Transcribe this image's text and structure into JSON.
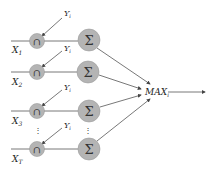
{
  "diagram": {
    "rows": [
      {
        "input": "X",
        "input_sub": "1",
        "weight": "Y",
        "weight_sub": "i",
        "and_symbol": "∩",
        "sum_symbol": "Σ",
        "cy_small": 41,
        "cy_big": 40,
        "label_y": 53,
        "y_label_y": 16
      },
      {
        "input": "X",
        "input_sub": "2",
        "weight": "Y",
        "weight_sub": "i",
        "and_symbol": "∩",
        "sum_symbol": "Σ",
        "cy_small": 72,
        "cy_big": 72,
        "label_y": 85,
        "y_label_y": 51
      },
      {
        "input": "X",
        "input_sub": "3",
        "weight": "Y",
        "weight_sub": "i",
        "and_symbol": "∩",
        "sum_symbol": "Σ",
        "cy_small": 111,
        "cy_big": 111,
        "label_y": 124,
        "y_label_y": 90
      },
      {
        "input": "X",
        "input_sub": "T",
        "weight": "Y",
        "weight_sub": "i",
        "and_symbol": "∩",
        "sum_symbol": "Σ",
        "cy_small": 149,
        "cy_big": 149,
        "label_y": 162,
        "y_label_y": 128
      }
    ],
    "ellipsis": "⋮",
    "output": {
      "label": "MAX",
      "label_sub": "i"
    },
    "colors": {
      "node_fill": "#b4b4b4",
      "node_stroke": "#9a9a9a",
      "line": "#555555"
    }
  }
}
